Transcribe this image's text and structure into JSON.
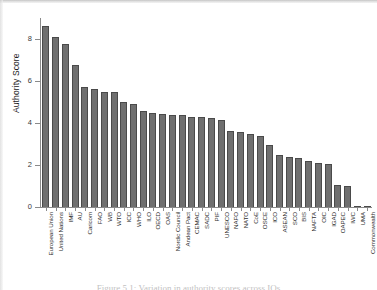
{
  "figure": {
    "y_axis_title": "Authority Score",
    "caption": "Figure 5.1: Variation in authority scores across IOs"
  },
  "chart_data": {
    "type": "bar",
    "title": "",
    "xlabel": "",
    "ylabel": "Authority Score",
    "ylim": [
      0,
      9
    ],
    "yticks": [
      0,
      2,
      4,
      6,
      8
    ],
    "grid": false,
    "legend": null,
    "bar_color": "#6f6f6f",
    "bar_edge_color": "#4a4a4a",
    "categories": [
      "European Union",
      "United Nations",
      "IMF",
      "AU",
      "Caricom",
      "FAO",
      "WB",
      "WTO",
      "ICC",
      "WHO",
      "ILO",
      "OECD",
      "OAS",
      "Nordic Council",
      "Andean Pact",
      "CEMAC",
      "SADC",
      "PIF",
      "UNESCO",
      "NAFO",
      "NATO",
      "CoE",
      "OSCE",
      "ICO",
      "ASEAN",
      "SCO",
      "BIS",
      "NAFTA",
      "OIC",
      "IGAD",
      "OAPEC",
      "IWC",
      "UMA",
      "Commonwealth"
    ],
    "values": [
      8.6,
      8.1,
      7.75,
      6.75,
      5.7,
      5.6,
      5.5,
      5.5,
      5.0,
      4.9,
      4.55,
      4.5,
      4.45,
      4.4,
      4.4,
      4.3,
      4.3,
      4.25,
      4.15,
      3.6,
      3.55,
      3.5,
      3.4,
      2.95,
      2.5,
      2.4,
      2.35,
      2.2,
      2.1,
      2.05,
      1.05,
      1.0,
      0.05,
      0.03
    ]
  }
}
